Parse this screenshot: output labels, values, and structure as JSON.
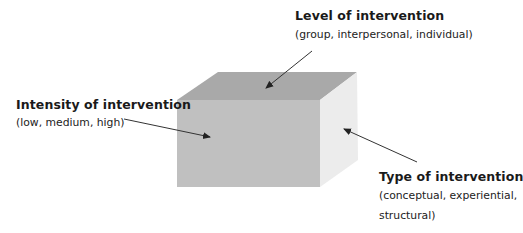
{
  "diagram": {
    "type": "3d-cube-dimensions",
    "cube": {
      "faces": {
        "top": {
          "color": "#a9a9a9",
          "points": "218,72 357,72 320,100 177,100"
        },
        "front": {
          "color": "#c0c0c0",
          "points": "177,100 320,100 320,187 177,187"
        },
        "side": {
          "color": "#ececec",
          "points": "320,100 357,72 358,160 320,187"
        }
      }
    },
    "arrow_color": "#333333",
    "labels": [
      {
        "id": "level",
        "title": "Level of intervention",
        "subtitle": "(group, interpersonal, individual)",
        "points_to": "top-face",
        "arrow": {
          "x1": 312,
          "y1": 51,
          "x2": 266,
          "y2": 88
        }
      },
      {
        "id": "intensity",
        "title": "Intensity of intervention",
        "subtitle": "(low, medium, high)",
        "points_to": "front-face",
        "arrow": {
          "x1": 124,
          "y1": 119,
          "x2": 210,
          "y2": 137
        }
      },
      {
        "id": "type",
        "title": "Type of intervention",
        "subtitle": "(conceptual, experiential,\nstructural)",
        "points_to": "side-face",
        "arrow": {
          "x1": 417,
          "y1": 162,
          "x2": 344,
          "y2": 129
        }
      }
    ]
  }
}
